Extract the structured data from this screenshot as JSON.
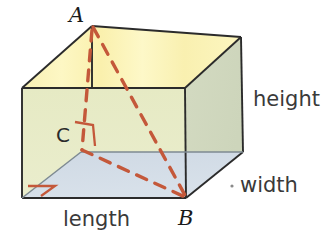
{
  "figure": {
    "shape": "rectangular prism",
    "vertex_labels": {
      "a": "A",
      "b": "B",
      "c": "C"
    },
    "dimension_labels": {
      "height": "height",
      "width": "width",
      "length": "length"
    },
    "colors": {
      "top_face": "#fbf2b0",
      "front_face": "#e8ebc9",
      "right_face": "#d4dbc4",
      "floor_face": "#d3dde7",
      "edge": "#2b2b2b",
      "dashed": "#c4583a",
      "right_angle": "#c4583a",
      "background": "#ffffff"
    },
    "annotations": {
      "dashed_segments": [
        "A to B",
        "A to C",
        "C to B"
      ],
      "right_angle_markers": [
        "at C",
        "at bottom-left floor corner"
      ]
    }
  }
}
